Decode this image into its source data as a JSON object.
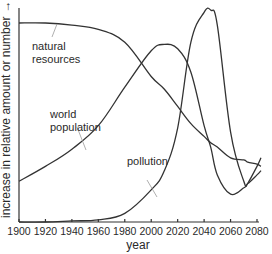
{
  "chart_data": {
    "type": "line",
    "title": "",
    "xlabel": "year",
    "ylabel": "increase in relative amount or number",
    "ylabel_arrow": "→",
    "xlim": [
      1900,
      2083
    ],
    "ylim": [
      0,
      100
    ],
    "x_ticks": [
      1900,
      1920,
      1940,
      1960,
      1980,
      2000,
      2020,
      2040,
      2060,
      2080
    ],
    "y_ticks": [],
    "grid": false,
    "legend": "inline labels",
    "x": [
      1900,
      1920,
      1940,
      1960,
      1980,
      2000,
      2010,
      2020,
      2030,
      2040,
      2045,
      2050,
      2060,
      2070,
      2073,
      2080,
      2083
    ],
    "series": [
      {
        "name": "natural resources",
        "label_lines": [
          "natural",
          "resources"
        ],
        "values": [
          93,
          93,
          92,
          90,
          84,
          68,
          62,
          54,
          46,
          40,
          37,
          35,
          30,
          29,
          28,
          27,
          26
        ]
      },
      {
        "name": "world population",
        "label_lines": [
          "world",
          "population"
        ],
        "values": [
          19,
          26,
          34,
          45,
          63,
          80,
          83,
          81,
          70,
          45,
          35,
          22,
          13,
          16,
          18,
          26,
          30
        ]
      },
      {
        "name": "pollution",
        "label_lines": [
          "pollution"
        ],
        "values": [
          0,
          0,
          0.5,
          1,
          4,
          15,
          24,
          44,
          84,
          98,
          99,
          92,
          42,
          19,
          18,
          22,
          24
        ]
      }
    ]
  }
}
